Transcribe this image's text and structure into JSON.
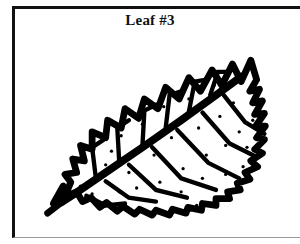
{
  "figure": {
    "caption": "Leaf #3",
    "frame_color": "#111111",
    "background_color": "#ffffff",
    "ink_color": "#000000"
  },
  "illustration": {
    "subject": "leaf",
    "style": "black-and-white line drawing",
    "orientation": "diagonal, base at lower-left, tip at upper-right",
    "margin_type": "serrated",
    "features": [
      "thick central midrib",
      "curved lateral veins",
      "zigzag serrated margin",
      "scattered speckle dots on blade",
      "short stem at base"
    ],
    "leaf_outline_path": "M 18 178 L 30 170 L 36 156 L 30 148 L 42 146 L 38 132 L 50 134 L 46 118 L 58 122 L 58 104 L 72 110 L 74 92 L 88 100 L 92 80 L 106 90 L 112 70 L 126 80 L 134 58 L 148 70 L 158 48 L 170 62 L 182 40 L 192 56 L 203 34 L 212 52 L 222 30 L 228 50 L 221 62 L 231 60 L 224 74 L 234 72 L 226 86 L 236 85 L 227 98 L 237 98 L 228 110 L 236 112 L 226 122 L 234 126 L 222 134 L 229 140 L 216 146 L 221 153 L 208 157 L 211 164 L 198 166 L 200 173 L 186 173 L 186 180 L 172 178 L 171 185 L 157 182 L 155 188 L 141 184 L 138 190 L 124 185 L 120 190 L 107 184 L 102 189 L 90 181 L 84 186 L 73 177 L 66 182 L 57 172 L 48 176 L 42 166 L 32 170 L 28 160 Z",
    "midrib_path": "M 26 177 L 40 168 L 72 146 L 110 120 L 150 92 L 186 66 L 212 47",
    "stem_path": "M 12 188 L 30 174",
    "veins_upper": [
      "M 62 153 L 58 120 L 70 112",
      "M 86 135 L 84 100 L 96 92",
      "M 110 118 L 112 82 L 124 76",
      "M 134 100 L 138 66 L 150 62",
      "M 158 83 L 164 52 L 176 50",
      "M 180 66 L 188 42 L 198 42"
    ],
    "veins_lower": [
      "M 52 170 L 72 180 L 92 178",
      "M 72 155 L 96 172 L 124 176",
      "M 96 138 L 124 164 L 156 172",
      "M 120 120 L 150 152 L 186 164",
      "M 146 102 L 178 136 L 210 152",
      "M 172 84 L 200 116 L 228 130",
      "M 194 66 L 216 94 L 236 106"
    ],
    "speckle_dots": [
      [
        64,
        150
      ],
      [
        78,
        124
      ],
      [
        96,
        146
      ],
      [
        88,
        108
      ],
      [
        110,
        96
      ],
      [
        122,
        128
      ],
      [
        132,
        78
      ],
      [
        140,
        110
      ],
      [
        152,
        142
      ],
      [
        158,
        70
      ],
      [
        168,
        100
      ],
      [
        176,
        128
      ],
      [
        184,
        56
      ],
      [
        190,
        88
      ],
      [
        196,
        118
      ],
      [
        204,
        74
      ],
      [
        210,
        104
      ],
      [
        214,
        140
      ],
      [
        58,
        168
      ],
      [
        72,
        138
      ],
      [
        104,
        162
      ],
      [
        128,
        156
      ],
      [
        150,
        166
      ],
      [
        172,
        152
      ],
      [
        196,
        148
      ],
      [
        218,
        120
      ],
      [
        224,
        92
      ],
      [
        46,
        160
      ],
      [
        86,
        166
      ],
      [
        166,
        180
      ]
    ]
  }
}
